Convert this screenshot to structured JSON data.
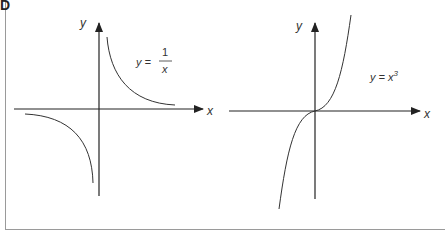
{
  "corner_label": "D",
  "graphs": [
    {
      "name": "reciprocal",
      "equation": "y = 1/x",
      "eq_lhs": "y =",
      "eq_num": "1",
      "eq_den": "x",
      "x_axis_label": "x",
      "y_axis_label": "y"
    },
    {
      "name": "cubic",
      "equation": "y = x^3",
      "eq_lhs": "y = x",
      "eq_exp": "3",
      "x_axis_label": "x",
      "y_axis_label": "y"
    }
  ],
  "colors": {
    "axis": "#222222",
    "curve": "#333333",
    "frame": "#9a9a9a"
  }
}
